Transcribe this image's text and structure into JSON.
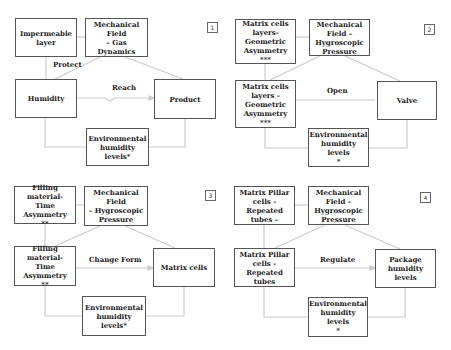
{
  "colors": {
    "box_border": "#555555",
    "line": "#cccccc",
    "text": "#222222"
  },
  "panels": [
    {
      "number": "1",
      "top_left": "Impermeable\nlayer",
      "mechanical": "Mechanical Field\n– Gas Dynamics",
      "side_label": "Protect",
      "source": "Humidity",
      "action": "Reach",
      "target": "Product",
      "environment": "Environmental\nhumidity levels*"
    },
    {
      "number": "2",
      "top_left": "Matrix cells\nlayers-\nGeometric\nAsymmetry ***",
      "mechanical": "Mechanical\nField –\nHygroscopic\nPressure",
      "side_label": "",
      "source": "Matrix cells\nlayers -\nGeometric\nAsymmetry ***",
      "action": "Open",
      "target": "Valve",
      "environment": "Environmental\nhumidity levels\n*"
    },
    {
      "number": "3",
      "top_left": "Filling material-\nTime Asymmetry\n**",
      "mechanical": "Mechanical Field\n– Hygroscopic\nPressure",
      "side_label": "",
      "source": "Filling material-\nTime Asymmetry\n**",
      "action": "Change Form",
      "target": "Matrix cells",
      "environment": "Environmental\nhumidity levels*"
    },
    {
      "number": "4",
      "top_left": "Matrix Pillar\ncells - Repeated\ntubes –",
      "mechanical": "Mechanical\nField –\nHygroscopic\nPressure",
      "side_label": "",
      "source": "Matrix Pillar\ncells - Repeated\ntubes",
      "action": "Regulate",
      "target": "Package\nhumidity levels",
      "environment": "Environmental\nhumidity levels\n*"
    }
  ]
}
